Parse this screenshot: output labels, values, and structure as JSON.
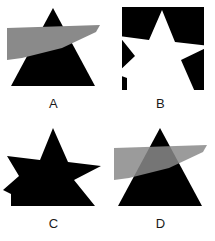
{
  "figure": {
    "background_color": "#ffffff",
    "panel_count": 4,
    "layout": "2x2 grid"
  },
  "colors": {
    "black": "#000000",
    "white": "#ffffff",
    "gray_light": "#8a8a8a",
    "gray_overlap": "#4a4a4a",
    "label_text": "#1a1a1a"
  },
  "panels": [
    {
      "label": "A",
      "description": "Black triangle with an opaque gray wing shape overlapping its upper portion",
      "shapes": [
        {
          "name": "triangle",
          "fill": "#000000",
          "points": "53,8 95,86 11,86"
        },
        {
          "name": "gray-wing",
          "fill": "#8a8a8a",
          "opacity": 1,
          "points": "7,28 100,25 96,32 62,48 22,58 7,60"
        }
      ]
    },
    {
      "label": "B",
      "description": "Black rectangle with a white star knocked out, star points extend past the right and bottom edges",
      "shapes": [
        {
          "name": "rectangle",
          "fill": "#000000",
          "points": "15,7 97,7 97,90 15,90"
        },
        {
          "name": "white-star",
          "fill": "#ffffff",
          "points": "55,10 68,42 103,46 74,60 88,92 20,92 20,78 9,74 28,56 12,36 42,40"
        }
      ]
    },
    {
      "label": "C",
      "description": "Solid black silhouette formed by the union of a star and a triangle",
      "shapes": [
        {
          "name": "union-silhouette",
          "fill": "#000000",
          "points": "53,8 68,42 101,46 74,60 95,86 11,86 11,74 3,70 19,56 7,36 40,40"
        }
      ]
    },
    {
      "label": "D",
      "description": "Black triangle with a semi-transparent gray wing overlapping, creating a dark gray intersection",
      "shapes": [
        {
          "name": "triangle",
          "fill": "#000000",
          "points": "53,8 95,86 11,86"
        },
        {
          "name": "gray-wing-translucent",
          "fill": "#8a8a8a",
          "opacity": 0.85,
          "points": "7,28 100,25 96,32 62,48 22,58 7,60"
        }
      ]
    }
  ]
}
